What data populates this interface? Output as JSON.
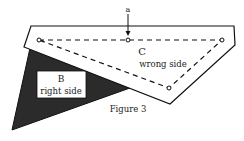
{
  "figure": {
    "caption": "Figure 3",
    "arrow_label": "a",
    "piece_b": {
      "letter": "B",
      "side": "right side"
    },
    "piece_c": {
      "letter": "C",
      "side": "wrong side"
    },
    "colors": {
      "dark_piece": "#2b2b2b",
      "outline": "#111111",
      "paper": "#ffffff"
    }
  }
}
